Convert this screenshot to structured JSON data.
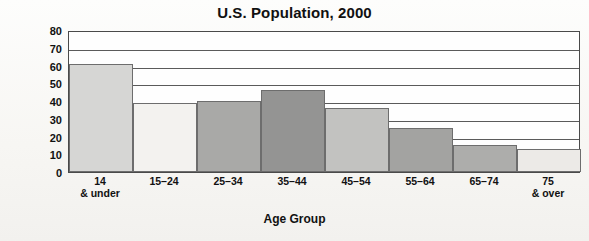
{
  "chart_data": {
    "type": "bar",
    "title": "U.S. Population, 2000",
    "xlabel": "Age Group",
    "ylabel": "Population (in millions)",
    "categories": [
      "14 & under",
      "15–24",
      "25–34",
      "35–44",
      "45–54",
      "55–64",
      "65–74",
      "75 & over"
    ],
    "category_lines": [
      [
        "14",
        "& under"
      ],
      [
        "15–24",
        ""
      ],
      [
        "25–34",
        ""
      ],
      [
        "35–44",
        ""
      ],
      [
        "45–54",
        ""
      ],
      [
        "55–64",
        ""
      ],
      [
        "65–74",
        ""
      ],
      [
        "75",
        "& over"
      ]
    ],
    "values": [
      61,
      39,
      40,
      46,
      36,
      25,
      15,
      13
    ],
    "ylim": [
      0,
      80
    ],
    "ytick_values": [
      80,
      70,
      60,
      50,
      40,
      30,
      20,
      10,
      0
    ],
    "ytick_labels": [
      "80",
      "70",
      "60",
      "50",
      "40",
      "30",
      "20",
      "10",
      "0"
    ],
    "grid": true,
    "grid_axis": "y",
    "legend": false,
    "bar_colors": [
      "#d6d6d4",
      "#f3f2ef",
      "#a9a9a7",
      "#949493",
      "#c2c2c0",
      "#a3a3a1",
      "#adadab",
      "#eceae7"
    ],
    "bar_edge_color": "#6d6d6d",
    "axis_color": "#4a4a4a",
    "background": "#fdfdfc"
  }
}
